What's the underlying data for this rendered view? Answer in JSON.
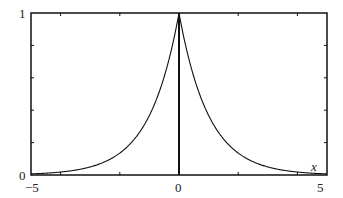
{
  "chart_data": {
    "type": "line",
    "title": "",
    "xlabel": "x",
    "ylabel": "",
    "xlim": [
      -5,
      5
    ],
    "ylim": [
      0,
      1
    ],
    "x_tick_labels": [
      "-5",
      "0",
      "5"
    ],
    "y_tick_labels": [
      "0",
      "1"
    ],
    "x_ticks": [
      -4,
      -2,
      2,
      4
    ],
    "y_ticks": [
      0.2,
      0.4,
      0.6,
      0.8
    ],
    "grid": false,
    "series": [
      {
        "name": "exp(-|x|)",
        "function": "e^{-|x|}",
        "x": [
          -5,
          -4,
          -3,
          -2,
          -1.5,
          -1,
          -0.5,
          0,
          0.5,
          1,
          1.5,
          2,
          3,
          4,
          5
        ],
        "y": [
          0.0067,
          0.018,
          0.05,
          0.135,
          0.223,
          0.368,
          0.607,
          1.0,
          0.607,
          0.368,
          0.223,
          0.135,
          0.05,
          0.018,
          0.0067
        ]
      }
    ],
    "vertical_line": {
      "x": 0,
      "y0": 0,
      "y1": 1
    }
  },
  "labels": {
    "y_top": "1",
    "y_bottom": "0",
    "x_left": "−5",
    "x_mid": "0",
    "x_right": "5",
    "x_axis_name": "x"
  }
}
